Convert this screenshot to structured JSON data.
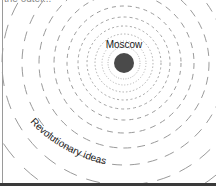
{
  "header": {
    "cropped_text": "the outer..."
  },
  "diagram": {
    "center_label": "Moscow",
    "outer_label": "Revolutionary ideas",
    "center": {
      "x": 124,
      "y": 63,
      "dot_radius": 10
    },
    "colors": {
      "dot": "#4a4a4a",
      "ring": "#9a9a9a",
      "text": "#1a1a1a"
    },
    "rings": [
      {
        "r": 16,
        "dash": "1 1.5",
        "width": 0.8
      },
      {
        "r": 22,
        "dash": "1 2",
        "width": 0.8
      },
      {
        "r": 29,
        "dash": "1.5 2",
        "width": 0.8
      },
      {
        "r": 37,
        "dash": "2 2.5",
        "width": 0.9
      },
      {
        "r": 46,
        "dash": "3 3",
        "width": 0.9
      },
      {
        "r": 57,
        "dash": "4 4",
        "width": 1
      },
      {
        "r": 70,
        "dash": "6 5",
        "width": 1
      },
      {
        "r": 85,
        "dash": "8 6",
        "width": 1
      },
      {
        "r": 102,
        "dash": "10 8",
        "width": 1
      },
      {
        "r": 122,
        "dash": "14 10",
        "width": 1
      },
      {
        "r": 145,
        "dash": "18 14",
        "width": 1
      }
    ]
  }
}
